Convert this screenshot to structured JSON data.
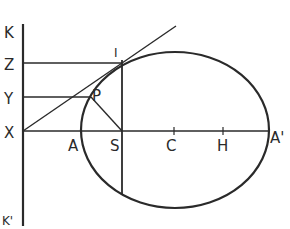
{
  "diagram": {
    "title": "",
    "labels": {
      "K": "K",
      "Z": "Z",
      "Y": "Y",
      "X": "X",
      "K_prime": "K'",
      "I": "I",
      "P": "P",
      "A": "A",
      "S": "S",
      "C": "C",
      "H": "H",
      "A_prime": "A'"
    },
    "colors": {
      "ink": "#2a2a2a",
      "background": "#ffffff"
    }
  }
}
